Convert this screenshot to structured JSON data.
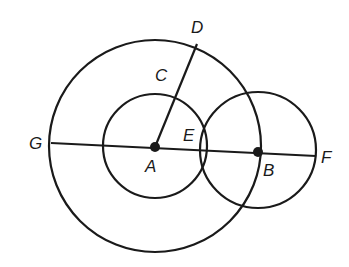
{
  "diagram": {
    "type": "geometry-circles",
    "stroke_color": "#1a1a1a",
    "background": "#ffffff",
    "points": {
      "A": {
        "label": "A",
        "x": 155,
        "y": 147
      },
      "B": {
        "label": "B",
        "x": 258,
        "y": 152
      },
      "C": {
        "label": "C"
      },
      "D": {
        "label": "D"
      },
      "E": {
        "label": "E"
      },
      "F": {
        "label": "F"
      },
      "G": {
        "label": "G"
      }
    },
    "circles": [
      {
        "name": "large-circle-A",
        "cx": 155,
        "cy": 146,
        "r": 106
      },
      {
        "name": "small-circle-A",
        "cx": 155,
        "cy": 146,
        "r": 52
      },
      {
        "name": "circle-B",
        "cx": 258,
        "cy": 150,
        "r": 58
      }
    ],
    "segments": [
      {
        "name": "segment-GF",
        "from": "G",
        "to": "F"
      },
      {
        "name": "segment-AD",
        "from": "A",
        "to": "D"
      }
    ]
  }
}
